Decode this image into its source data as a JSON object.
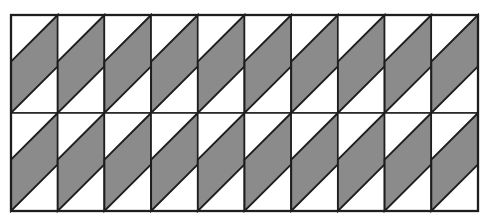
{
  "figure": {
    "kind": "tiled-parallelogram-pattern",
    "grid": {
      "rows": 2,
      "cols": 10
    },
    "bounds": {
      "x": 11,
      "y": 15,
      "width": 467,
      "height": 196
    },
    "cell": {
      "diagonal_drop": 46.7
    },
    "colors": {
      "background": "#ffffff",
      "cell_fill": "#ffffff",
      "shaded_fill": "#8b8b8b",
      "outline": "#1e1e1e"
    },
    "stroke": {
      "cell_width": 1.5,
      "shape_width": 1.9,
      "outer_width": 2.3
    }
  }
}
